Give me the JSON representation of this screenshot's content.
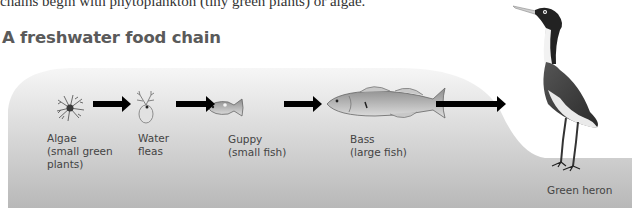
{
  "header": {
    "intro_text": "chains begin with phytoplankton (tiny green plants) or algae.",
    "title": "A freshwater food chain"
  },
  "colors": {
    "background_light": "#f4f4f4",
    "background_dark": "#b9b9b9",
    "arrow": "#000000",
    "title": "#5a5a5a",
    "label": "#444444"
  },
  "food_chain": [
    {
      "organism": "algae",
      "icon": "algae-icon",
      "label": "Algae\n(small green\nplants)"
    },
    {
      "organism": "water-fleas",
      "icon": "water-flea-icon",
      "label": "Water\nfleas"
    },
    {
      "organism": "guppy",
      "icon": "guppy-icon",
      "label": "Guppy\n(small fish)"
    },
    {
      "organism": "bass",
      "icon": "bass-icon",
      "label": "Bass\n(large fish)"
    },
    {
      "organism": "green-heron",
      "icon": "heron-icon",
      "label": "Green heron"
    }
  ],
  "arrows": [
    "arrow-right-icon",
    "arrow-right-icon",
    "arrow-right-icon",
    "arrow-right-icon"
  ]
}
